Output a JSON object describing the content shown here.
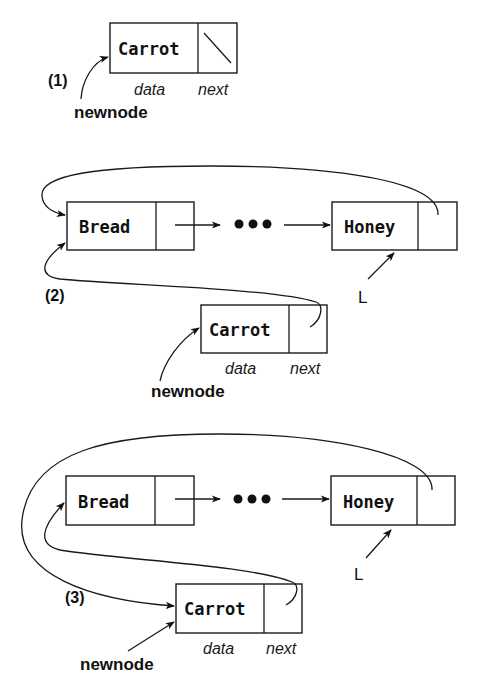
{
  "figure": {
    "steps": [
      {
        "label": "(1)",
        "nodes": [
          {
            "id": "carrot",
            "data": "Carrot",
            "next": "null"
          }
        ],
        "field_labels": {
          "data": "data",
          "next": "next"
        },
        "pointers": [
          {
            "name": "newnode",
            "target": "carrot"
          }
        ]
      },
      {
        "label": "(2)",
        "nodes": [
          {
            "id": "bread",
            "data": "Bread"
          },
          {
            "id": "honey",
            "data": "Honey"
          },
          {
            "id": "carrot",
            "data": "Carrot"
          }
        ],
        "ellipsis": "•••",
        "field_labels": {
          "data": "data",
          "next": "next"
        },
        "pointers": [
          {
            "name": "L",
            "target": "honey"
          },
          {
            "name": "newnode",
            "target": "carrot"
          }
        ],
        "links": [
          {
            "from": "bread.next",
            "to": "…"
          },
          {
            "from": "…",
            "to": "honey"
          },
          {
            "from": "honey.next",
            "to": "bread"
          },
          {
            "from": "carrot.next",
            "to": "bread"
          }
        ]
      },
      {
        "label": "(3)",
        "nodes": [
          {
            "id": "bread",
            "data": "Bread"
          },
          {
            "id": "honey",
            "data": "Honey"
          },
          {
            "id": "carrot",
            "data": "Carrot"
          }
        ],
        "ellipsis": "•••",
        "field_labels": {
          "data": "data",
          "next": "next"
        },
        "pointers": [
          {
            "name": "L",
            "target": "honey"
          },
          {
            "name": "newnode",
            "target": "carrot"
          }
        ],
        "links": [
          {
            "from": "bread.next",
            "to": "…"
          },
          {
            "from": "…",
            "to": "honey"
          },
          {
            "from": "honey.next",
            "to": "carrot"
          },
          {
            "from": "carrot.next",
            "to": "bread"
          }
        ]
      }
    ]
  }
}
